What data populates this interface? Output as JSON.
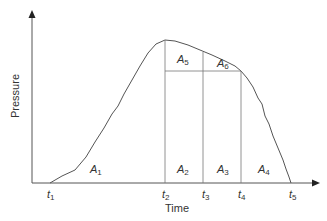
{
  "diagram": {
    "x_axis_title": "Time",
    "y_axis_title": "Pressure",
    "time_markers": [
      {
        "base": "t",
        "sub": "1"
      },
      {
        "base": "t",
        "sub": "2"
      },
      {
        "base": "t",
        "sub": "3"
      },
      {
        "base": "t",
        "sub": "4"
      },
      {
        "base": "t",
        "sub": "5"
      }
    ],
    "areas": [
      {
        "base": "A",
        "sub": "1"
      },
      {
        "base": "A",
        "sub": "2"
      },
      {
        "base": "A",
        "sub": "3"
      },
      {
        "base": "A",
        "sub": "4"
      },
      {
        "base": "A",
        "sub": "5"
      },
      {
        "base": "A",
        "sub": "6"
      }
    ],
    "colors": {
      "line": "#555555",
      "text": "#333333",
      "background": "#ffffff"
    }
  }
}
